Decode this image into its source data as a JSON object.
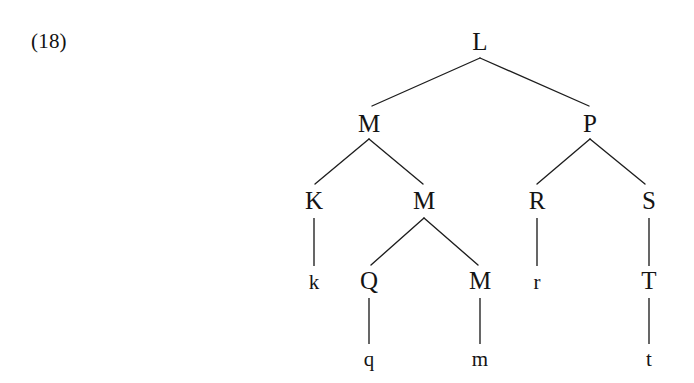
{
  "figure": {
    "example_number": "(18)",
    "caption": "",
    "background_color": "#ffffff",
    "ink_color": "#141414"
  },
  "tree": {
    "nodes": [
      {
        "id": "L",
        "label": "L",
        "kind": "nonterminal",
        "x": 480,
        "y": 50,
        "depth": 0
      },
      {
        "id": "M1",
        "label": "M",
        "kind": "nonterminal",
        "x": 369,
        "y": 132,
        "depth": 1
      },
      {
        "id": "P",
        "label": "P",
        "kind": "nonterminal",
        "x": 590,
        "y": 132,
        "depth": 1
      },
      {
        "id": "K",
        "label": "K",
        "kind": "nonterminal",
        "x": 314,
        "y": 209,
        "depth": 2
      },
      {
        "id": "M2",
        "label": "M",
        "kind": "nonterminal",
        "x": 424,
        "y": 209,
        "depth": 2
      },
      {
        "id": "R",
        "label": "R",
        "kind": "nonterminal",
        "x": 537,
        "y": 209,
        "depth": 2
      },
      {
        "id": "S",
        "label": "S",
        "kind": "nonterminal",
        "x": 649,
        "y": 209,
        "depth": 2
      },
      {
        "id": "k",
        "label": "k",
        "kind": "terminal",
        "x": 314,
        "y": 289,
        "depth": 3
      },
      {
        "id": "Q",
        "label": "Q",
        "kind": "nonterminal",
        "x": 369,
        "y": 289,
        "depth": 3
      },
      {
        "id": "M3",
        "label": "M",
        "kind": "nonterminal",
        "x": 480,
        "y": 289,
        "depth": 3
      },
      {
        "id": "r",
        "label": "r",
        "kind": "terminal",
        "x": 537,
        "y": 289,
        "depth": 3
      },
      {
        "id": "T",
        "label": "T",
        "kind": "nonterminal",
        "x": 649,
        "y": 289,
        "depth": 3
      },
      {
        "id": "q",
        "label": "q",
        "kind": "terminal",
        "x": 369,
        "y": 366,
        "depth": 4
      },
      {
        "id": "m",
        "label": "m",
        "kind": "terminal",
        "x": 480,
        "y": 366,
        "depth": 4
      },
      {
        "id": "t",
        "label": "t",
        "kind": "terminal",
        "x": 649,
        "y": 366,
        "depth": 4
      }
    ],
    "edges": [
      {
        "from": "L",
        "to": "M1",
        "x1": 480,
        "y1": 58,
        "x2": 372,
        "y2": 106,
        "style": "diagonal"
      },
      {
        "from": "L",
        "to": "P",
        "x1": 480,
        "y1": 58,
        "x2": 589,
        "y2": 106,
        "style": "diagonal"
      },
      {
        "from": "M1",
        "to": "K",
        "x1": 369,
        "y1": 139,
        "x2": 315,
        "y2": 184,
        "style": "diagonal"
      },
      {
        "from": "M1",
        "to": "M2",
        "x1": 369,
        "y1": 139,
        "x2": 423,
        "y2": 184,
        "style": "diagonal"
      },
      {
        "from": "P",
        "to": "R",
        "x1": 590,
        "y1": 139,
        "x2": 537,
        "y2": 184,
        "style": "diagonal"
      },
      {
        "from": "P",
        "to": "S",
        "x1": 590,
        "y1": 139,
        "x2": 645,
        "y2": 184,
        "style": "diagonal"
      },
      {
        "from": "K",
        "to": "k",
        "x1": 314,
        "y1": 218,
        "x2": 314,
        "y2": 266,
        "style": "vertical"
      },
      {
        "from": "M2",
        "to": "Q",
        "x1": 424,
        "y1": 218,
        "x2": 371,
        "y2": 265,
        "style": "diagonal"
      },
      {
        "from": "M2",
        "to": "M3",
        "x1": 424,
        "y1": 218,
        "x2": 478,
        "y2": 265,
        "style": "diagonal"
      },
      {
        "from": "R",
        "to": "r",
        "x1": 537,
        "y1": 218,
        "x2": 537,
        "y2": 266,
        "style": "vertical"
      },
      {
        "from": "S",
        "to": "T",
        "x1": 649,
        "y1": 218,
        "x2": 649,
        "y2": 266,
        "style": "vertical"
      },
      {
        "from": "Q",
        "to": "q",
        "x1": 369,
        "y1": 298,
        "x2": 369,
        "y2": 344,
        "style": "vertical"
      },
      {
        "from": "M3",
        "to": "m",
        "x1": 480,
        "y1": 298,
        "x2": 480,
        "y2": 344,
        "style": "vertical"
      },
      {
        "from": "T",
        "to": "t",
        "x1": 649,
        "y1": 298,
        "x2": 649,
        "y2": 344,
        "style": "vertical"
      }
    ]
  }
}
